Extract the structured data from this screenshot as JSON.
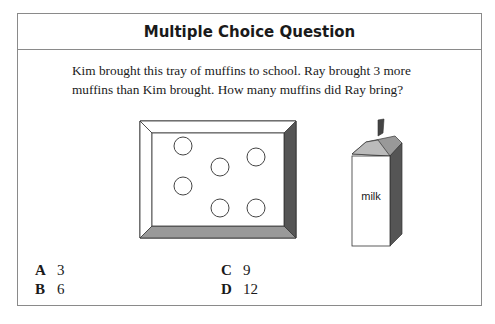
{
  "header": {
    "title": "Multiple Choice Question"
  },
  "question": {
    "text": "Kim brought this tray of muffins to school. Ray brought 3 more muffins than Kim brought. How many muffins did Ray bring?"
  },
  "figure": {
    "tray": {
      "muffin_count": 6
    },
    "carton": {
      "label": "milk"
    }
  },
  "choices": [
    {
      "letter": "A",
      "value": "3"
    },
    {
      "letter": "B",
      "value": "6"
    },
    {
      "letter": "C",
      "value": "9"
    },
    {
      "letter": "D",
      "value": "12"
    }
  ]
}
